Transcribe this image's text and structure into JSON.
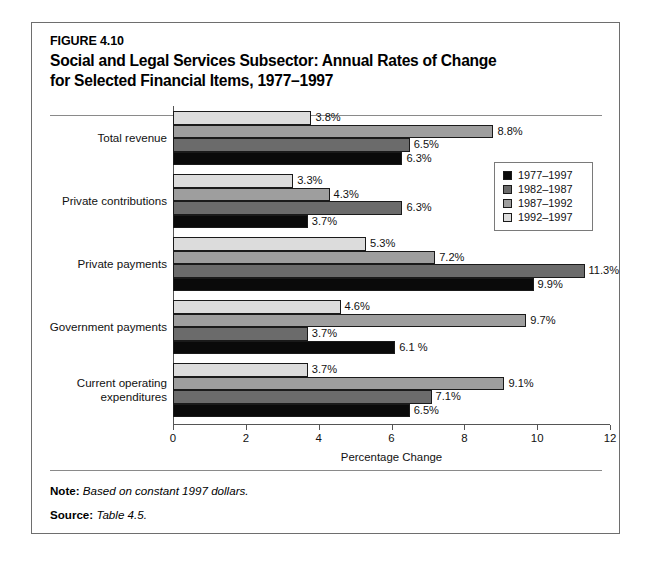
{
  "figure": {
    "number": "FIGURE 4.10",
    "title_line1": "Social and Legal Services Subsector: Annual Rates of Change",
    "title_line2": "for Selected Financial Items, 1977–1997"
  },
  "notes": {
    "note_label": "Note:",
    "note_text": "Based on constant 1997 dollars.",
    "source_label": "Source:",
    "source_text": "Table 4.5."
  },
  "legend": {
    "position": "inside-right-upper",
    "entries": [
      {
        "label": "1977–1997",
        "color": "#0a0a0a"
      },
      {
        "label": "1982–1987",
        "color": "#6b6b6b"
      },
      {
        "label": "1987–1992",
        "color": "#9e9e9e"
      },
      {
        "label": "1992–1997",
        "color": "#dcdcdc"
      }
    ]
  },
  "chart_data": {
    "type": "bar",
    "orientation": "horizontal",
    "title": "Social and Legal Services Subsector: Annual Rates of Change for Selected Financial Items, 1977–1997",
    "xlabel": "Percentage Change",
    "ylabel": "",
    "xlim": [
      0,
      12
    ],
    "xticks": [
      0,
      2,
      4,
      6,
      8,
      10,
      12
    ],
    "xtick_labels": [
      "0",
      "2",
      "4",
      "6",
      "8",
      "10",
      "12"
    ],
    "grid": false,
    "categories": [
      "Total revenue",
      "Private contributions",
      "Private payments",
      "Government payments",
      "Current operating expenditures"
    ],
    "series": [
      {
        "name": "1977–1997",
        "color": "#0a0a0a",
        "values": [
          6.3,
          3.7,
          9.9,
          6.1,
          6.5
        ],
        "labels": [
          "6.3%",
          "3.7%",
          "9.9%",
          "6.1 %",
          "6.5%"
        ]
      },
      {
        "name": "1982–1987",
        "color": "#6b6b6b",
        "values": [
          6.5,
          6.3,
          11.3,
          3.7,
          7.1
        ],
        "labels": [
          "6.5%",
          "6.3%",
          "11.3%",
          "3.7%",
          "7.1%"
        ]
      },
      {
        "name": "1987–1992",
        "color": "#9e9e9e",
        "values": [
          8.8,
          4.3,
          7.2,
          9.7,
          9.1
        ],
        "labels": [
          "8.8%",
          "4.3%",
          "7.2%",
          "9.7%",
          "9.1%"
        ]
      },
      {
        "name": "1992–1997",
        "color": "#dcdcdc",
        "values": [
          3.8,
          3.3,
          5.3,
          4.6,
          3.7
        ],
        "labels": [
          "3.8%",
          "3.3%",
          "5.3%",
          "4.6%",
          "3.7%"
        ]
      }
    ]
  }
}
